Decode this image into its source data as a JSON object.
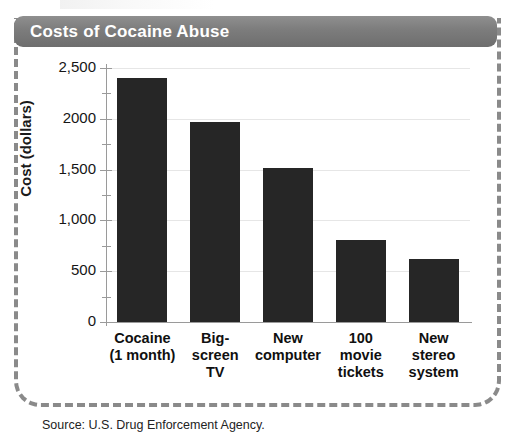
{
  "title": "Costs of Cocaine Abuse",
  "source_note": "Source: U.S. Drug Enforcement Agency.",
  "axis": {
    "y_title": "Cost (dollars)"
  },
  "colors": {
    "bar": "#262626",
    "title_bar": "#7c7c7c",
    "title_text": "#ffffff",
    "gridline": "#e6e6e6",
    "axis": "#9a9a9a",
    "frame_dash": "#8a8a8a"
  },
  "chart_data": {
    "type": "bar",
    "title": "Costs of Cocaine Abuse",
    "xlabel": "",
    "ylabel": "Cost (dollars)",
    "ylim": [
      0,
      2500
    ],
    "grid": true,
    "legend": "none",
    "categories": [
      "Cocaine\n(1 month)",
      "Big-\nscreen\nTV",
      "New\ncomputer",
      "100\nmovie\ntickets",
      "New\nstereo\nsystem"
    ],
    "values": [
      2400,
      1970,
      1520,
      810,
      620
    ],
    "ytick_values": [
      0,
      500,
      1000,
      1500,
      2000,
      2500
    ],
    "ytick_labels": [
      "0",
      "500",
      "1,000",
      "1,500",
      "2000",
      "2,500"
    ],
    "yminor_ticks": [
      250,
      750,
      1250,
      1750,
      2250
    ]
  }
}
